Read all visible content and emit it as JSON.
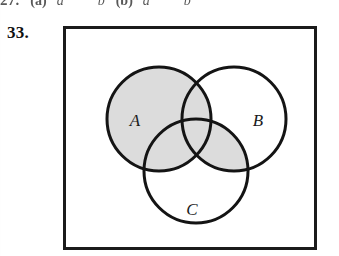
{
  "page": {
    "background_color": "#ffffff",
    "ink_color": "#1b1b1b"
  },
  "clipped_line": {
    "number": "27.",
    "part_a_label": "(a)",
    "part_a_var1": "a",
    "part_a_var2": "b",
    "part_b_label": "(b)",
    "part_b_var1": "a",
    "part_b_var2": "b"
  },
  "exercise": {
    "number": "33."
  },
  "figure": {
    "type": "venn-diagram",
    "frame": {
      "shape": "rectangle",
      "stroke_color": "#1b1b1b",
      "fill_color": "#ffffff",
      "stroke_width": 3
    },
    "shaded_color": "#dcdcdc",
    "unshaded_color": "#ffffff",
    "circle_stroke_color": "#141414",
    "circle_stroke_width": 3,
    "circles": [
      {
        "label": "A",
        "cx": 97,
        "cy": 94,
        "r": 52,
        "label_x": 73,
        "label_y": 101
      },
      {
        "label": "B",
        "cx": 172,
        "cy": 94,
        "r": 52,
        "label_x": 196,
        "label_y": 101
      },
      {
        "label": "C",
        "cx": 134,
        "cy": 146,
        "r": 52,
        "label_x": 130,
        "label_y": 190
      }
    ],
    "shaded_regions": [
      "A only",
      "A and B only",
      "A and C only",
      "A and B and C",
      "B and C only"
    ],
    "unshaded_regions": [
      "B only",
      "C only",
      "outside all circles"
    ]
  }
}
